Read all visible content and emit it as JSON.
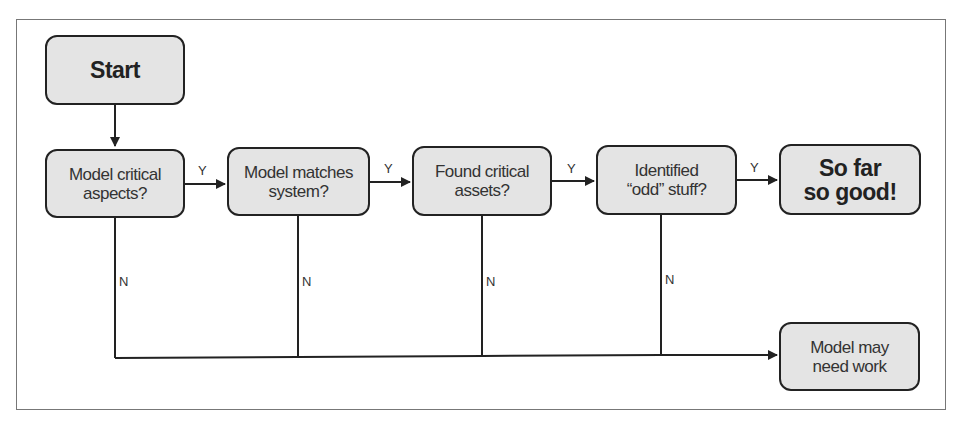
{
  "diagram": {
    "type": "flowchart",
    "start": {
      "label": "Start"
    },
    "decisions": [
      {
        "label": "Model critical\naspects?"
      },
      {
        "label": "Model matches\nsystem?"
      },
      {
        "label": "Found critical\nassets?"
      },
      {
        "label": "Identified\n“odd” stuff?"
      }
    ],
    "success": {
      "label": "So far\nso good!"
    },
    "failure": {
      "label": "Model may\nneed work"
    },
    "edge_labels": {
      "yes": "Y",
      "no": "N"
    }
  }
}
